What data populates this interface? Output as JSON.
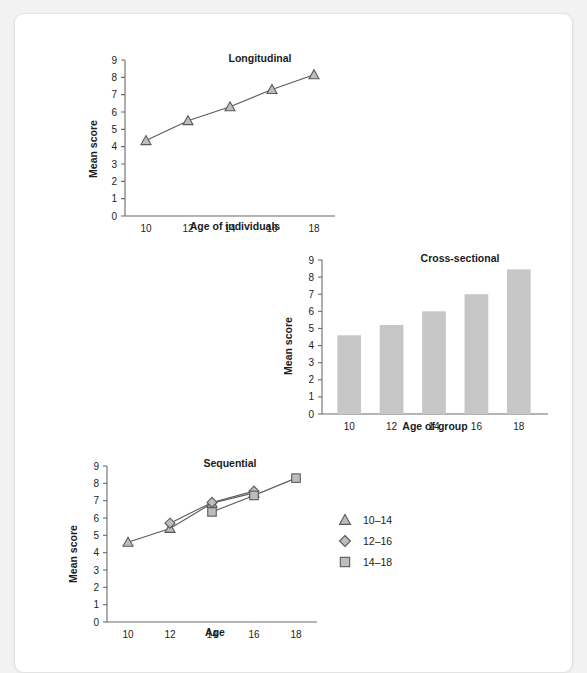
{
  "page": {
    "background_color": "#f2f2f2",
    "card_color": "#ffffff",
    "accent_gray": "#c6c6c6",
    "line_color": "#5a5a5a"
  },
  "chart_data": [
    {
      "id": "longitudinal",
      "type": "line",
      "title": "Longitudinal",
      "xlabel": "Age of individuals",
      "ylabel": "Mean score",
      "x": [
        10,
        12,
        14,
        16,
        18
      ],
      "xtick_labels": [
        "10",
        "12",
        "14",
        "16",
        "18"
      ],
      "ytick_labels": [
        "0",
        "1",
        "2",
        "3",
        "4",
        "5",
        "6",
        "7",
        "8",
        "9"
      ],
      "xlim": [
        9,
        19
      ],
      "ylim": [
        0,
        9
      ],
      "grid": false,
      "legend": "none",
      "series": [
        {
          "name": "Longitudinal cohort",
          "marker": "triangle",
          "values": [
            4.35,
            5.5,
            6.3,
            7.3,
            8.15
          ]
        }
      ]
    },
    {
      "id": "cross-sectional",
      "type": "bar",
      "title": "Cross-sectional",
      "xlabel": "Age of group",
      "ylabel": "Mean score",
      "categories": [
        "10",
        "12",
        "14",
        "16",
        "18"
      ],
      "values": [
        4.6,
        5.2,
        6.0,
        7.0,
        8.45
      ],
      "ytick_labels": [
        "0",
        "1",
        "2",
        "3",
        "4",
        "5",
        "6",
        "7",
        "8",
        "9"
      ],
      "ylim": [
        0,
        9
      ],
      "grid": false,
      "legend": "none",
      "bar_color": "#c6c6c6"
    },
    {
      "id": "sequential",
      "type": "line",
      "title": "Sequential",
      "xlabel": "Age",
      "ylabel": "Mean score",
      "x": [
        10,
        12,
        14,
        16,
        18
      ],
      "xtick_labels": [
        "10",
        "12",
        "14",
        "16",
        "18"
      ],
      "ytick_labels": [
        "0",
        "1",
        "2",
        "3",
        "4",
        "5",
        "6",
        "7",
        "8",
        "9"
      ],
      "xlim": [
        9,
        19
      ],
      "ylim": [
        0,
        9
      ],
      "grid": false,
      "legend": "right",
      "series": [
        {
          "name": "10–14",
          "marker": "triangle",
          "x": [
            10,
            12,
            14,
            16
          ],
          "values": [
            4.6,
            5.4,
            6.85,
            7.45
          ]
        },
        {
          "name": "12–16",
          "marker": "diamond",
          "x": [
            12,
            14,
            16
          ],
          "values": [
            5.7,
            6.9,
            7.55
          ]
        },
        {
          "name": "14–18",
          "marker": "square",
          "x": [
            14,
            16,
            18
          ],
          "values": [
            6.35,
            7.3,
            8.3
          ]
        }
      ],
      "legend_items": [
        {
          "label": "10–14",
          "marker": "triangle"
        },
        {
          "label": "12–16",
          "marker": "diamond"
        },
        {
          "label": "14–18",
          "marker": "square"
        }
      ]
    }
  ]
}
